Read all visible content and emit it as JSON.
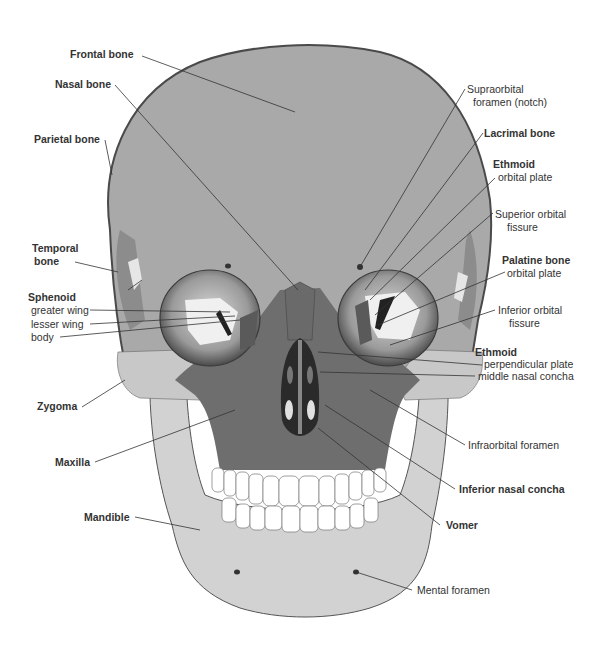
{
  "figure": {
    "colors": {
      "cranium": "#a9a9a9",
      "cranium_outline": "#5a5a5a",
      "face_dark": "#6e6e6e",
      "zygoma_light": "#c8c8c8",
      "mandible": "#d2d2d2",
      "orbit": "#9a9a9a",
      "nasal_cavity": "#2a2a2a",
      "teeth": "#ffffff",
      "leader_line": "#333333",
      "label_text": "#333333"
    }
  },
  "labels": {
    "frontal_bone": "Frontal bone",
    "nasal_bone": "Nasal bone",
    "parietal_bone": "Parietal bone",
    "temporal_bone_1": "Temporal",
    "temporal_bone_2": "bone",
    "sphenoid": "Sphenoid",
    "sphenoid_greater_wing": "greater wing",
    "sphenoid_lesser_wing": "lesser wing",
    "sphenoid_body": "body",
    "zygoma": "Zygoma",
    "maxilla": "Maxilla",
    "mandible": "Mandible",
    "supraorbital_1": "Supraorbital",
    "supraorbital_2": "foramen (notch)",
    "lacrimal_bone": "Lacrimal bone",
    "ethmoid_1": "Ethmoid",
    "ethmoid_orbital_plate": "orbital plate",
    "superior_orbital_1": "Superior orbital",
    "superior_orbital_2": "fissure",
    "palatine_bone": "Palatine bone",
    "palatine_orbital_plate": "orbital plate",
    "inferior_orbital_1": "Inferior orbital",
    "inferior_orbital_2": "fissure",
    "ethmoid_2": "Ethmoid",
    "ethmoid_perpendicular_plate": "perpendicular plate",
    "ethmoid_middle_nasal_concha": "middle nasal concha",
    "infraorbital_foramen": "Infraorbital foramen",
    "inferior_nasal_concha": "Inferior nasal concha",
    "vomer": "Vomer",
    "mental_foramen": "Mental foramen"
  }
}
